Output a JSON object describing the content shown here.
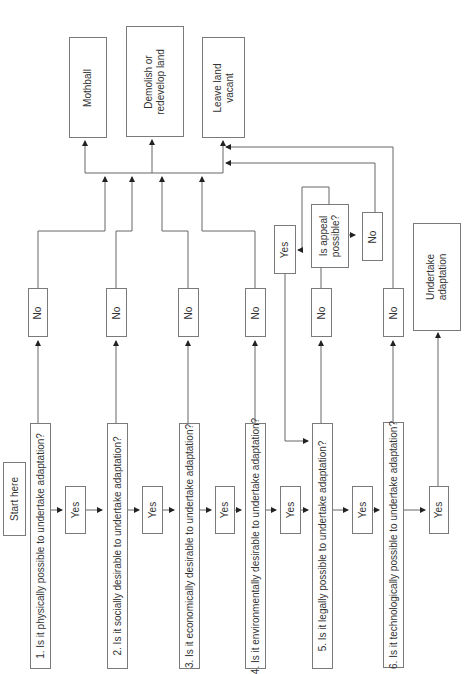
{
  "diagram": {
    "start": "Start here",
    "questions": [
      "1. Is it physically possible to undertake adaptation?",
      "2. Is it socially desirable to undertake adaptation?",
      "3. Is it economically desirable to undertake adaptation?",
      "4. Is it environmentally desirable to undertake adaptation?",
      "5. Is it legally possible to undertake adaptation?",
      "6. Is it technologically possible to undertake adaptation?"
    ],
    "yes_label": "Yes",
    "no_label": "No",
    "appeal_question": "Is appeal possible?",
    "outcomes": {
      "mothball": "Mothball",
      "demolish": "Demolish or redevelop land",
      "vacant": "Leave land vacant",
      "adapt": "Undertake adaptation"
    },
    "colors": {
      "line": "#555555",
      "border": "#7a7a7a"
    }
  }
}
